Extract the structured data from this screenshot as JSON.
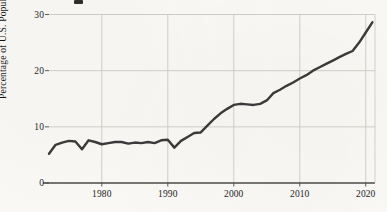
{
  "chart_data": {
    "type": "line",
    "title": "",
    "xlabel": "",
    "ylabel": "Percentage of U.S. Population",
    "xlim": [
      1972,
      1921
    ],
    "ylim": [
      0,
      30
    ],
    "grid": true,
    "legend": "none",
    "line_color": "#3a3a3a",
    "background_color": "#fbfaf7",
    "gridline_color": "#c9c7c2",
    "axis_color": "#4a4a4a",
    "y_ticks": [
      0,
      10,
      20,
      30
    ],
    "y_tick_labels": [
      "0",
      "10",
      "20",
      "30"
    ],
    "x_ticks": [
      1980,
      1990,
      2000,
      2010,
      2020
    ],
    "x_tick_labels": [
      "1980",
      "1990",
      "2000",
      "2010",
      "2020"
    ],
    "x": [
      1972,
      1973,
      1974,
      1975,
      1976,
      1977,
      1978,
      1979,
      1980,
      1981,
      1982,
      1983,
      1984,
      1985,
      1986,
      1987,
      1988,
      1989,
      1990,
      1991,
      1992,
      1993,
      1994,
      1995,
      1996,
      1997,
      1998,
      1999,
      2000,
      2001,
      2002,
      2003,
      2004,
      2005,
      2006,
      2007,
      2008,
      2009,
      2010,
      2011,
      2012,
      2013,
      2014,
      2015,
      2016,
      2017,
      2018,
      2019,
      2020,
      2021
    ],
    "values": [
      5.2,
      6.8,
      7.2,
      7.5,
      7.4,
      6.0,
      7.6,
      7.3,
      6.9,
      7.1,
      7.3,
      7.3,
      7.0,
      7.2,
      7.1,
      7.3,
      7.1,
      7.6,
      7.7,
      6.3,
      7.5,
      8.2,
      8.9,
      9.0,
      10.2,
      11.4,
      12.4,
      13.2,
      13.9,
      14.1,
      14.0,
      13.9,
      14.1,
      14.7,
      16.0,
      16.6,
      17.3,
      17.9,
      18.6,
      19.2,
      20.0,
      20.6,
      21.2,
      21.8,
      22.4,
      23.0,
      23.5,
      25.0,
      26.8,
      28.6
    ],
    "y_value_min": 5.2,
    "y_value_max": 28.6,
    "first_year": 1972,
    "last_year": 2021
  },
  "axes": {
    "y_title": "Percentage of U.S. Population"
  }
}
